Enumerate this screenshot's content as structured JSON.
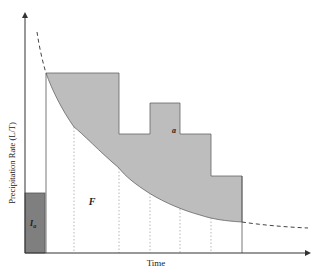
{
  "diagram": {
    "axes": {
      "x_label": "Time",
      "y_label": "Precipitation Rate (L/T)"
    },
    "labels": {
      "initial_abstraction": "I",
      "initial_abstraction_sub": "a",
      "infiltration": "F",
      "runoff": "a"
    },
    "colors": {
      "excess_fill": "#bdbdbd",
      "initial_abstraction_fill": "#7f7f7f",
      "axis": "#333333",
      "curve": "#555555",
      "gridline": "#999999"
    },
    "hyetograph_bars": [
      {
        "x0": 46,
        "x1": 119,
        "top": 73
      },
      {
        "x0": 119,
        "x1": 150,
        "top": 134
      },
      {
        "x0": 150,
        "x1": 180,
        "top": 103
      },
      {
        "x0": 180,
        "x1": 211,
        "top": 134
      },
      {
        "x0": 211,
        "x1": 242,
        "top": 176
      }
    ]
  }
}
